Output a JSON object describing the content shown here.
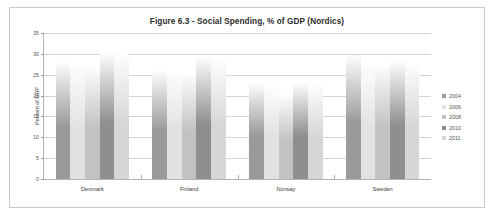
{
  "chart_data": {
    "type": "bar",
    "title": "Figure 6.3 - Social Spending, % of GDP (Nordics)",
    "xlabel": "",
    "ylabel": "Percent of GDP",
    "ylim": [
      0,
      35
    ],
    "yticks": [
      0,
      5,
      10,
      15,
      20,
      25,
      30,
      35
    ],
    "grid": true,
    "legend_position": "right",
    "categories": [
      "Denmark",
      "Finland",
      "Norway",
      "Sweden"
    ],
    "series": [
      {
        "name": "2004",
        "values": [
          28.0,
          26.0,
          23.0,
          29.7
        ],
        "color": "#9a9a9a"
      },
      {
        "name": "2006",
        "values": [
          27.3,
          25.8,
          22.3,
          27.4
        ],
        "color": "#e2e2e2"
      },
      {
        "name": "2008",
        "values": [
          26.8,
          25.2,
          20.1,
          27.4
        ],
        "color": "#c2c2c2"
      },
      {
        "name": "2010",
        "values": [
          30.2,
          29.3,
          23.0,
          28.2
        ],
        "color": "#8f8f8f"
      },
      {
        "name": "2011",
        "values": [
          30.0,
          28.6,
          22.6,
          27.5
        ],
        "color": "#d6d6d6"
      }
    ]
  },
  "legend": {
    "items": [
      {
        "label": "2004"
      },
      {
        "label": "2006"
      },
      {
        "label": "2008"
      },
      {
        "label": "2010"
      },
      {
        "label": "2011"
      }
    ]
  }
}
